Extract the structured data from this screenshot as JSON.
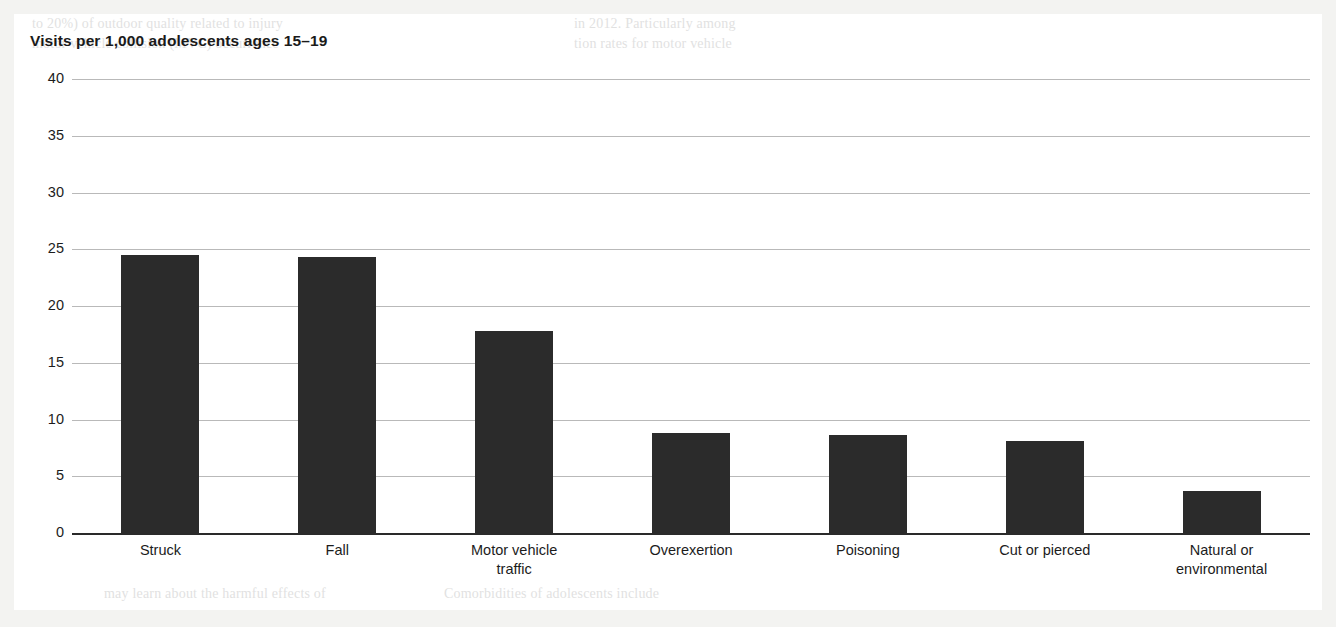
{
  "figure": {
    "title": "Visits per 1,000 adolescents ages 15–19"
  },
  "page_bleed": [
    {
      "text": "to 20%) of outdoor quality related to injury",
      "x": 18,
      "y": 2,
      "size": 14
    },
    {
      "text": "motor vehicle collision (MVC) occurrence",
      "x": 18,
      "y": 22,
      "size": 14
    },
    {
      "text": "in 2012. Particularly among",
      "x": 560,
      "y": 2,
      "size": 14
    },
    {
      "text": "tion rates for motor vehicle",
      "x": 560,
      "y": 22,
      "size": 14
    },
    {
      "text": "may learn about the harmful effects of",
      "x": 90,
      "y": 572,
      "size": 14
    },
    {
      "text": "Comorbidities of adolescents include",
      "x": 430,
      "y": 572,
      "size": 14
    }
  ],
  "chart_data": {
    "type": "bar",
    "title": "Visits per 1,000 adolescents ages 15–19",
    "xlabel": "",
    "ylabel": "Visits per 1,000 adolescents ages 15–19",
    "categories": [
      "Struck",
      "Fall",
      "Motor vehicle traffic",
      "Overexertion",
      "Poisoning",
      "Cut or pierced",
      "Natural or environmental"
    ],
    "category_lines": [
      [
        "Struck"
      ],
      [
        "Fall"
      ],
      [
        "Motor vehicle",
        "traffic"
      ],
      [
        "Overexertion"
      ],
      [
        "Poisoning"
      ],
      [
        "Cut or pierced"
      ],
      [
        "Natural or",
        "environmental"
      ]
    ],
    "values": [
      24.5,
      24.3,
      17.8,
      8.8,
      8.6,
      8.1,
      3.7
    ],
    "ylim": [
      0,
      40
    ],
    "yticks": [
      0,
      5,
      10,
      15,
      20,
      25,
      30,
      35,
      40
    ],
    "ytick_labels": [
      "0",
      "5",
      "10",
      "15",
      "20",
      "25",
      "30",
      "35",
      "40"
    ],
    "grid": true,
    "legend": "none",
    "bar_color": "#2b2b2b",
    "grid_color": "#b9b9b9",
    "axis_color": "#2a2a2a"
  }
}
